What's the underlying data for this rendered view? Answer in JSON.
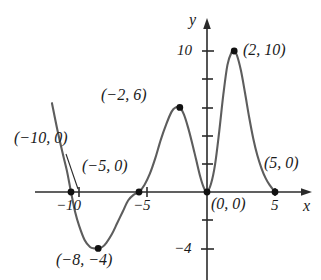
{
  "figure": {
    "kind": "cartesian-graph",
    "background_color": "#ffffff",
    "curve_color": "#5d5d5d",
    "axis_color": "#2b2b2b",
    "point_color": "#111111"
  },
  "axes": {
    "x_axis_name": "x",
    "y_axis_name": "y",
    "origin_px": {
      "x": 207,
      "y": 192
    },
    "x_scale_px_per_unit": 13.6,
    "y_scale_px_per_unit": 14.1,
    "x_tick_labels": [
      "−10",
      "−5",
      "5"
    ],
    "y_tick_labels": [
      "10",
      "−4"
    ]
  },
  "annotations": {
    "p_minus10": "(−10, 0)",
    "p_minus5": "(−5, 0)",
    "p_minus2": "(−2, 6)",
    "p_minus8": "(−8, −4)",
    "p_origin": "(0, 0)",
    "p_two": "(2, 10)",
    "p_five": "(5, 0)"
  },
  "chart_data": {
    "type": "line",
    "title": "",
    "xlabel": "x",
    "ylabel": "y",
    "grid": false,
    "legend": "none",
    "xlim": [
      -12.6,
      7.6
    ],
    "ylim": [
      -6.2,
      12.0
    ],
    "x_ticks": [
      -10,
      -5,
      5
    ],
    "y_ticks": [
      10,
      -4
    ],
    "y_minor_ticks": [
      2,
      4,
      6,
      8,
      -2
    ],
    "labeled_points": [
      {
        "label": "(−10, 0)",
        "x": -10,
        "y": 0
      },
      {
        "label": "(−8, −4)",
        "x": -8,
        "y": -4
      },
      {
        "label": "(−5, 0)",
        "x": -5,
        "y": 0
      },
      {
        "label": "(−2, 6)",
        "x": -2,
        "y": 6
      },
      {
        "label": "(0, 0)",
        "x": 0,
        "y": 0
      },
      {
        "label": "(2, 10)",
        "x": 2,
        "y": 10
      },
      {
        "label": "(5, 0)",
        "x": 5,
        "y": 0
      }
    ],
    "series": [
      {
        "name": "curve",
        "x": [
          -11.4,
          -11.0,
          -10.6,
          -10.3,
          -10.0,
          -9.7,
          -9.4,
          -9.0,
          -8.6,
          -8.3,
          -8.0,
          -7.7,
          -7.4,
          -7.0,
          -6.6,
          -6.2,
          -5.8,
          -5.4,
          -5.0,
          -4.6,
          -4.2,
          -3.8,
          -3.4,
          -3.0,
          -2.6,
          -2.3,
          -2.0,
          -1.7,
          -1.4,
          -1.1,
          -0.8,
          -0.5,
          -0.25,
          0.0,
          0.3,
          0.6,
          0.9,
          1.2,
          1.5,
          1.8,
          2.0,
          2.2,
          2.5,
          2.8,
          3.1,
          3.4,
          3.7,
          4.0,
          4.3,
          4.6,
          5.0
        ],
        "y": [
          6.3,
          4.4,
          2.7,
          1.5,
          0.0,
          -1.4,
          -2.4,
          -3.4,
          -3.9,
          -4.0,
          -4.0,
          -3.9,
          -3.6,
          -3.0,
          -2.2,
          -1.4,
          -0.6,
          -0.2,
          0.0,
          0.5,
          1.3,
          2.4,
          3.7,
          4.8,
          5.7,
          6.0,
          6.0,
          5.5,
          4.6,
          3.5,
          2.3,
          1.1,
          0.35,
          0.0,
          0.6,
          2.0,
          4.3,
          6.9,
          9.0,
          9.9,
          10.0,
          9.7,
          8.6,
          7.0,
          5.3,
          3.8,
          2.6,
          1.7,
          1.0,
          0.5,
          0.0
        ]
      }
    ]
  }
}
